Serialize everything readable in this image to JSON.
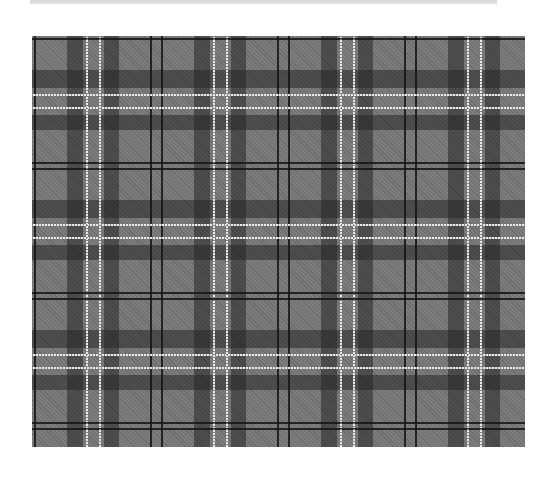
{
  "image": {
    "subject": "Gray tartan plaid fabric pattern",
    "description": "Gray tartan with dark charcoal bands, paired white stripes and dotted black lines",
    "colors": {
      "background": "#ffffff",
      "top_bar": "#dcdcdc",
      "base_gray": "#7c7c7c",
      "dark_band": "#3c3c3c",
      "white_stripe": "#e8e8e8",
      "black_line": "#141414"
    },
    "pattern": {
      "horizontal_repeat_px": 127,
      "vertical_repeat_px": 130
    }
  }
}
